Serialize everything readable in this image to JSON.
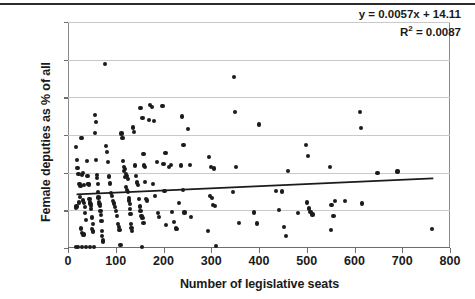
{
  "chart_data": {
    "type": "scatter",
    "title": "",
    "xlabel": "Number of legislative seats",
    "ylabel": "Female deputies as % of all",
    "xlim": [
      0,
      800
    ],
    "ylim": [
      0,
      60
    ],
    "xticks": [
      "0",
      "100",
      "200",
      "300",
      "400",
      "500",
      "600",
      "700",
      "800"
    ],
    "xtick_values": [
      0,
      100,
      200,
      300,
      400,
      500,
      600,
      700,
      800
    ],
    "yticks": [
      "0.0",
      "10.0",
      "20.0",
      "30.0",
      "40.0",
      "50.0",
      "60.0"
    ],
    "ytick_values": [
      0,
      10,
      20,
      30,
      40,
      50,
      60
    ],
    "grid": "horizontal",
    "legend": "none",
    "marker_color": "#1b1b1b",
    "gridline_color": "#c9c9c9",
    "axis_color": "#6e6e6e",
    "trendline_color": "#1b1b1b",
    "annotations": {
      "equation": "y = 0.0057x + 14.11",
      "r_squared_prefix": "R",
      "r_squared_exponent": "2",
      "r_squared_value": " = 0.0087"
    },
    "trendline": {
      "slope": 0.0057,
      "intercept": 14.11,
      "x_start": 18,
      "x_end": 765
    },
    "points": [
      [
        16,
        0.2
      ],
      [
        21,
        0.2
      ],
      [
        30,
        0.2
      ],
      [
        38,
        0.2
      ],
      [
        46,
        0.2
      ],
      [
        55,
        0.2
      ],
      [
        17,
        26.8
      ],
      [
        19,
        23.3
      ],
      [
        20,
        21.3
      ],
      [
        18,
        11.0
      ],
      [
        17,
        10.6
      ],
      [
        22,
        19.7
      ],
      [
        24,
        17.0
      ],
      [
        26,
        16.5
      ],
      [
        25,
        13.6
      ],
      [
        23,
        12.1
      ],
      [
        28,
        29.3
      ],
      [
        30,
        29.1
      ],
      [
        31,
        19.9
      ],
      [
        29,
        19.4
      ],
      [
        33,
        16.8
      ],
      [
        32,
        12.6
      ],
      [
        34,
        11.9
      ],
      [
        35,
        10.9
      ],
      [
        36,
        9.2
      ],
      [
        37,
        7.4
      ],
      [
        27,
        5.2
      ],
      [
        29,
        4.0
      ],
      [
        33,
        3.6
      ],
      [
        31,
        3.4
      ],
      [
        40,
        23.1
      ],
      [
        41,
        19.1
      ],
      [
        42,
        17.0
      ],
      [
        43,
        16.9
      ],
      [
        44,
        16.8
      ],
      [
        45,
        13.1
      ],
      [
        46,
        12.1
      ],
      [
        47,
        11.6
      ],
      [
        48,
        11.2
      ],
      [
        49,
        10.3
      ],
      [
        50,
        8.1
      ],
      [
        52,
        6.3
      ],
      [
        51,
        5.1
      ],
      [
        53,
        4.4
      ],
      [
        56,
        35.3
      ],
      [
        58,
        33.4
      ],
      [
        57,
        30.6
      ],
      [
        59,
        23.4
      ],
      [
        60,
        19.3
      ],
      [
        61,
        18.6
      ],
      [
        62,
        16.9
      ],
      [
        63,
        14.9
      ],
      [
        64,
        13.4
      ],
      [
        65,
        12.3
      ],
      [
        66,
        11.6
      ],
      [
        67,
        11.1
      ],
      [
        68,
        9.8
      ],
      [
        69,
        8.8
      ],
      [
        70,
        7.2
      ],
      [
        71,
        4.6
      ],
      [
        72,
        3.2
      ],
      [
        73,
        2.0
      ],
      [
        74,
        1.6
      ],
      [
        78,
        48.8
      ],
      [
        80,
        27.0
      ],
      [
        82,
        25.4
      ],
      [
        84,
        22.9
      ],
      [
        86,
        19.0
      ],
      [
        88,
        17.1
      ],
      [
        90,
        14.6
      ],
      [
        92,
        13.8
      ],
      [
        94,
        12.5
      ],
      [
        96,
        11.8
      ],
      [
        98,
        10.9
      ],
      [
        100,
        9.8
      ],
      [
        102,
        8.5
      ],
      [
        104,
        6.3
      ],
      [
        106,
        5.6
      ],
      [
        108,
        4.7
      ],
      [
        110,
        0.9
      ],
      [
        112,
        30.4
      ],
      [
        114,
        29.1
      ],
      [
        116,
        23.2
      ],
      [
        118,
        21.5
      ],
      [
        120,
        20.9
      ],
      [
        117,
        20.4
      ],
      [
        121,
        19.6
      ],
      [
        123,
        19.2
      ],
      [
        119,
        18.9
      ],
      [
        125,
        18.4
      ],
      [
        122,
        16.2
      ],
      [
        124,
        15.5
      ],
      [
        126,
        14.8
      ],
      [
        127,
        13.2
      ],
      [
        128,
        12.6
      ],
      [
        129,
        11.6
      ],
      [
        130,
        10.4
      ],
      [
        131,
        9.1
      ],
      [
        132,
        6.3
      ],
      [
        133,
        5.4
      ],
      [
        134,
        4.6
      ],
      [
        136,
        32.0
      ],
      [
        138,
        30.7
      ],
      [
        140,
        21.9
      ],
      [
        142,
        19.2
      ],
      [
        144,
        17.4
      ],
      [
        146,
        16.8
      ],
      [
        148,
        13.1
      ],
      [
        150,
        11.0
      ],
      [
        152,
        9.9
      ],
      [
        154,
        8.4
      ],
      [
        156,
        7.9
      ],
      [
        158,
        6.6
      ],
      [
        152,
        37.1
      ],
      [
        156,
        34.6
      ],
      [
        160,
        21.9
      ],
      [
        162,
        21.5
      ],
      [
        158,
        24.9
      ],
      [
        161,
        17.5
      ],
      [
        163,
        13.0
      ],
      [
        165,
        12.6
      ],
      [
        155,
        0.2
      ],
      [
        172,
        38.0
      ],
      [
        176,
        37.5
      ],
      [
        170,
        33.9
      ],
      [
        180,
        33.8
      ],
      [
        186,
        22.8
      ],
      [
        178,
        17.0
      ],
      [
        182,
        13.8
      ],
      [
        188,
        9.2
      ],
      [
        190,
        8.2
      ],
      [
        198,
        37.6
      ],
      [
        204,
        25.2
      ],
      [
        200,
        22.4
      ],
      [
        202,
        15.2
      ],
      [
        206,
        6.1
      ],
      [
        212,
        21.4
      ],
      [
        216,
        22.0
      ],
      [
        218,
        9.5
      ],
      [
        222,
        7.0
      ],
      [
        226,
        5.2
      ],
      [
        228,
        5.1
      ],
      [
        232,
        12.0
      ],
      [
        238,
        34.9
      ],
      [
        242,
        27.4
      ],
      [
        236,
        21.9
      ],
      [
        240,
        15.5
      ],
      [
        244,
        9.4
      ],
      [
        252,
        31.6
      ],
      [
        256,
        22.0
      ],
      [
        258,
        8.3
      ],
      [
        296,
        24.1
      ],
      [
        300,
        21.4
      ],
      [
        306,
        21.1
      ],
      [
        298,
        13.9
      ],
      [
        302,
        13.2
      ],
      [
        304,
        11.4
      ],
      [
        308,
        11.1
      ],
      [
        294,
        4.5
      ],
      [
        310,
        0.6
      ],
      [
        348,
        45.5
      ],
      [
        350,
        36.2
      ],
      [
        352,
        21.4
      ],
      [
        346,
        14.9
      ],
      [
        358,
        6.7
      ],
      [
        390,
        9.4
      ],
      [
        396,
        6.5
      ],
      [
        400,
        32.8
      ],
      [
        436,
        15.2
      ],
      [
        442,
        10.1
      ],
      [
        448,
        15.0
      ],
      [
        452,
        5.6
      ],
      [
        456,
        3.1
      ],
      [
        460,
        20.5
      ],
      [
        482,
        9.2
      ],
      [
        498,
        27.4
      ],
      [
        502,
        24.4
      ],
      [
        500,
        12.1
      ],
      [
        504,
        10.5
      ],
      [
        508,
        9.6
      ],
      [
        512,
        8.9
      ],
      [
        548,
        21.4
      ],
      [
        552,
        11.5
      ],
      [
        556,
        8.6
      ],
      [
        550,
        4.8
      ],
      [
        560,
        12.5
      ],
      [
        580,
        12.4
      ],
      [
        612,
        36.2
      ],
      [
        614,
        31.9
      ],
      [
        616,
        11.8
      ],
      [
        648,
        19.9
      ],
      [
        690,
        20.3
      ],
      [
        762,
        5.1
      ]
    ]
  }
}
